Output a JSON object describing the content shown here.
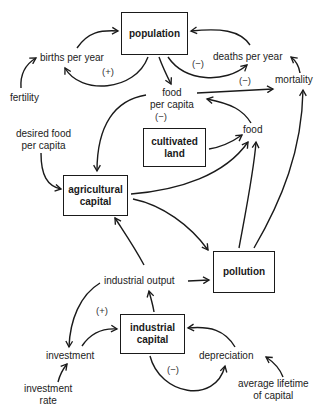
{
  "diagram": {
    "type": "causal-loop-diagram",
    "stocks": {
      "population": "population",
      "cultivated_land_1": "cultivated",
      "cultivated_land_2": "land",
      "agricultural_capital_1": "agricultural",
      "agricultural_capital_2": "capital",
      "pollution": "pollution",
      "industrial_capital_1": "industrial",
      "industrial_capital_2": "capital"
    },
    "variables": {
      "births_per_year": "births per year",
      "deaths_per_year": "deaths per year",
      "fertility": "fertility",
      "mortality": "mortality",
      "food_per_capita_1": "food",
      "food_per_capita_2": "per capita",
      "food": "food",
      "desired_food_per_capita_1": "desired food",
      "desired_food_per_capita_2": "per capita",
      "industrial_output": "industrial output",
      "investment": "investment",
      "investment_rate_1": "investment",
      "investment_rate_2": "rate",
      "depreciation": "depreciation",
      "avg_lifetime_1": "average lifetime",
      "avg_lifetime_2": "of capital"
    },
    "loop_signs": {
      "births_loop": "(+)",
      "deaths_loop": "(−)",
      "mortality_link": "(−)",
      "food_per_capita_loop": "(−)",
      "investment_loop": "(+)",
      "depreciation_loop": "(−)"
    },
    "links": [
      {
        "from": "births per year",
        "to": "population"
      },
      {
        "from": "population",
        "to": "births per year"
      },
      {
        "from": "fertility",
        "to": "births per year"
      },
      {
        "from": "deaths per year",
        "to": "population"
      },
      {
        "from": "population",
        "to": "deaths per year"
      },
      {
        "from": "mortality",
        "to": "deaths per year"
      },
      {
        "from": "population",
        "to": "food per capita"
      },
      {
        "from": "food per capita",
        "to": "mortality"
      },
      {
        "from": "food",
        "to": "food per capita"
      },
      {
        "from": "food per capita",
        "to": "agricultural capital"
      },
      {
        "from": "desired food per capita",
        "to": "agricultural capital"
      },
      {
        "from": "cultivated land",
        "to": "food"
      },
      {
        "from": "agricultural capital",
        "to": "food"
      },
      {
        "from": "agricultural capital",
        "to": "pollution"
      },
      {
        "from": "pollution",
        "to": "food"
      },
      {
        "from": "pollution",
        "to": "mortality"
      },
      {
        "from": "industrial output",
        "to": "agricultural capital"
      },
      {
        "from": "industrial output",
        "to": "pollution"
      },
      {
        "from": "industrial output",
        "to": "investment"
      },
      {
        "from": "investment",
        "to": "industrial capital"
      },
      {
        "from": "investment rate",
        "to": "investment"
      },
      {
        "from": "industrial capital",
        "to": "industrial output"
      },
      {
        "from": "industrial capital",
        "to": "depreciation"
      },
      {
        "from": "depreciation",
        "to": "industrial capital"
      },
      {
        "from": "average lifetime of capital",
        "to": "depreciation"
      }
    ]
  }
}
